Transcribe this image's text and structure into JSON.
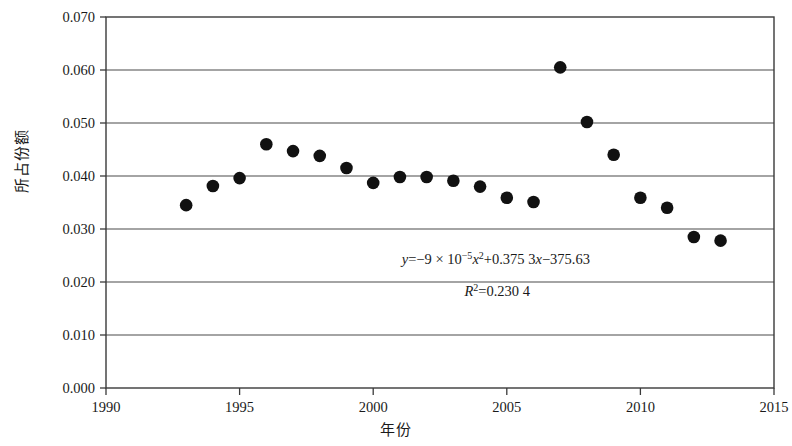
{
  "chart_data": {
    "type": "scatter",
    "title": "",
    "xlabel": "年份",
    "ylabel": "所占份额",
    "xlim": [
      1990,
      2015
    ],
    "ylim": [
      0.0,
      0.07
    ],
    "xticks": [
      "1990",
      "1995",
      "2000",
      "2005",
      "2010",
      "2015"
    ],
    "yticks": [
      "0.000",
      "0.010",
      "0.020",
      "0.030",
      "0.040",
      "0.050",
      "0.060",
      "0.070"
    ],
    "grid": "horizontal",
    "legend": "none",
    "x": [
      1993,
      1994,
      1995,
      1996,
      1997,
      1998,
      1999,
      2000,
      2001,
      2002,
      2003,
      2004,
      2005,
      2006,
      2007,
      2008,
      2009,
      2010,
      2011,
      2012,
      2013
    ],
    "values": [
      0.0345,
      0.0381,
      0.0396,
      0.046,
      0.0447,
      0.0438,
      0.0415,
      0.0387,
      0.0398,
      0.0398,
      0.0391,
      0.038,
      0.0359,
      0.0351,
      0.0605,
      0.0502,
      0.044,
      0.0359,
      0.034,
      0.0285,
      0.0278
    ],
    "marker": "filled-circle",
    "marker_color": "#111111",
    "trendline": {
      "type": "polynomial-order-2",
      "style": "dotted",
      "color": "#111111",
      "x_start": 1993,
      "x_end": 2013,
      "a": -9e-05,
      "b": 0.3753,
      "c": -375.63
    },
    "annotations": {
      "equation_prefix": "y",
      "equation_eq": "=−9 × 10",
      "equation_exp1": "−5",
      "equation_x": "x",
      "equation_exp2": "2",
      "equation_rest": "+0.375 3",
      "equation_x2": "x",
      "equation_tail": "−375.63",
      "r2_label": "R",
      "r2_sup": "2",
      "r2_value": "=0.230 4",
      "equation_full": "y=−9 × 10−5x2+0.375 3x−375.63",
      "r2_full": "R2=0.230 4"
    },
    "axis_color": "#3a3a3a",
    "grid_color": "#4a4a4a"
  }
}
